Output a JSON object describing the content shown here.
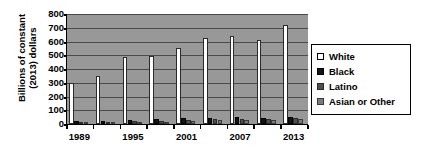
{
  "chart_data": {
    "type": "bar",
    "title": "",
    "xlabel": "",
    "ylabel_line1": "Billions of constant",
    "ylabel_line2": "(2013) dollars",
    "ylim": [
      0,
      800
    ],
    "ytick_values": [
      800,
      700,
      600,
      500,
      400,
      300,
      200,
      100,
      0
    ],
    "ytick_labels": [
      "800",
      "700",
      "600",
      "500",
      "400",
      "300",
      "200",
      "100",
      "0"
    ],
    "grid": true,
    "legend_position": "right",
    "categories": [
      "1989",
      "1992",
      "1995",
      "1998",
      "2001",
      "2004",
      "2007",
      "2010",
      "2013"
    ],
    "visible_xtick_labels": [
      "1989",
      "1995",
      "2001",
      "2007",
      "2013"
    ],
    "series": [
      {
        "name": "White",
        "color": "#ffffff",
        "values": [
          300,
          352,
          485,
          497,
          555,
          625,
          642,
          612,
          720
        ]
      },
      {
        "name": "Black",
        "color": "#141414",
        "values": [
          22,
          24,
          30,
          35,
          42,
          45,
          50,
          42,
          52
        ]
      },
      {
        "name": "Latino",
        "color": "#4f4f4f",
        "values": [
          14,
          16,
          20,
          24,
          30,
          34,
          38,
          33,
          41
        ]
      },
      {
        "name": "Asian or Other",
        "color": "#7b7b7b",
        "values": [
          10,
          12,
          15,
          18,
          22,
          26,
          30,
          26,
          33
        ]
      }
    ]
  },
  "legend": {
    "items": [
      {
        "label": "White"
      },
      {
        "label": "Black"
      },
      {
        "label": "Latino"
      },
      {
        "label": "Asian or Other"
      }
    ]
  }
}
